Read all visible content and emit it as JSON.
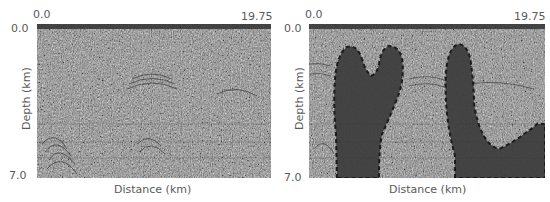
{
  "figure": {
    "panels": [
      {
        "id": "left",
        "x_start_label": "0.0",
        "x_end_label": "19.75",
        "y_top_label": "0.0",
        "y_bottom_label": "7.0",
        "xlabel": "Distance (km)",
        "ylabel": "Depth (km)",
        "content": "seismic migrated image (no overlay)"
      },
      {
        "id": "right",
        "x_start_label": "0.0",
        "x_end_label": "19.75",
        "y_top_label": "0.0",
        "y_bottom_label": "7.0",
        "xlabel": "Distance (km)",
        "ylabel": "Depth (km)",
        "content": "seismic image with shaded salt bodies outlined by dashed boundary"
      }
    ],
    "colors": {
      "background": "#ffffff",
      "seismic_mid": "#8a8a8a",
      "salt_fill": "#3c3c3c",
      "salt_outline": "#111111",
      "label": "#5a5a5a"
    }
  }
}
